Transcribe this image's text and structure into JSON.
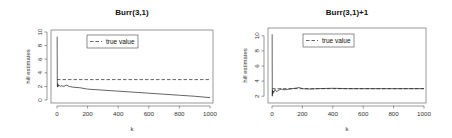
{
  "chart_data": [
    {
      "type": "line",
      "title": "Burr(3,1)",
      "xlabel": "k",
      "ylabel": "hill estimates",
      "xlim": [
        0,
        1000
      ],
      "ylim": [
        0,
        10
      ],
      "xticks": [
        0,
        200,
        400,
        600,
        800,
        1000
      ],
      "yticks": [
        0,
        2,
        4,
        6,
        8,
        10
      ],
      "grid": false,
      "legend": {
        "position": "top-center",
        "entries": [
          {
            "label": "true value",
            "style": "dashed"
          }
        ]
      },
      "series": [
        {
          "name": "hill estimates",
          "style": "solid",
          "x": [
            1,
            2,
            3,
            5,
            8,
            12,
            20,
            30,
            45,
            60,
            80,
            100,
            150,
            200,
            300,
            400,
            500,
            600,
            700,
            800,
            900,
            1000
          ],
          "values": [
            9.3,
            2.5,
            1.9,
            2.4,
            2.0,
            2.2,
            2.0,
            2.1,
            2.0,
            2.2,
            2.0,
            1.9,
            1.8,
            1.6,
            1.45,
            1.3,
            1.15,
            1.0,
            0.85,
            0.7,
            0.55,
            0.35
          ]
        },
        {
          "name": "true value",
          "style": "dashed",
          "x": [
            0,
            1000
          ],
          "values": [
            3.0,
            3.0
          ]
        }
      ]
    },
    {
      "type": "line",
      "title": "Burr(3,1)+1",
      "xlabel": "k",
      "ylabel": "hill estimates",
      "xlim": [
        0,
        1000
      ],
      "ylim": [
        1.5,
        10.5
      ],
      "xticks": [
        0,
        200,
        400,
        600,
        800,
        1000
      ],
      "yticks": [
        2,
        4,
        6,
        8,
        10
      ],
      "grid": false,
      "legend": {
        "position": "top-center",
        "entries": [
          {
            "label": "true value",
            "style": "dashed"
          }
        ]
      },
      "series": [
        {
          "name": "hill estimates",
          "style": "solid",
          "x": [
            1,
            2,
            3,
            5,
            8,
            12,
            20,
            30,
            45,
            60,
            80,
            100,
            150,
            180,
            200,
            250,
            300,
            400,
            500,
            600,
            700,
            800,
            900,
            1000
          ],
          "values": [
            10.2,
            2.0,
            2.8,
            2.3,
            2.7,
            2.5,
            2.9,
            2.6,
            2.8,
            2.95,
            2.85,
            2.9,
            3.05,
            3.15,
            3.0,
            2.95,
            3.0,
            3.05,
            3.0,
            3.0,
            3.0,
            3.0,
            3.0,
            3.0
          ]
        },
        {
          "name": "true value",
          "style": "dashed",
          "x": [
            0,
            1000
          ],
          "values": [
            3.0,
            3.0
          ]
        }
      ]
    }
  ],
  "panels": [
    {
      "box": {
        "x0": 51,
        "y0": 30,
        "x1": 213,
        "y1": 103
      },
      "xmap": {
        "px0": 57,
        "px1": 210
      },
      "ymap": {
        "py0": 100,
        "py1": 32
      },
      "title_pos": {
        "x": 132,
        "y": 15
      },
      "legend_box": {
        "x": 87,
        "y": 35,
        "w": 51,
        "h": 13
      }
    },
    {
      "box": {
        "x0": 268,
        "y0": 28,
        "x1": 426,
        "y1": 103
      },
      "xmap": {
        "px0": 272,
        "px1": 424
      },
      "ymap": {
        "py0": 100,
        "py1": 32
      },
      "title_pos": {
        "x": 347,
        "y": 15
      },
      "legend_box": {
        "x": 303,
        "y": 34,
        "w": 51,
        "h": 13
      }
    }
  ]
}
